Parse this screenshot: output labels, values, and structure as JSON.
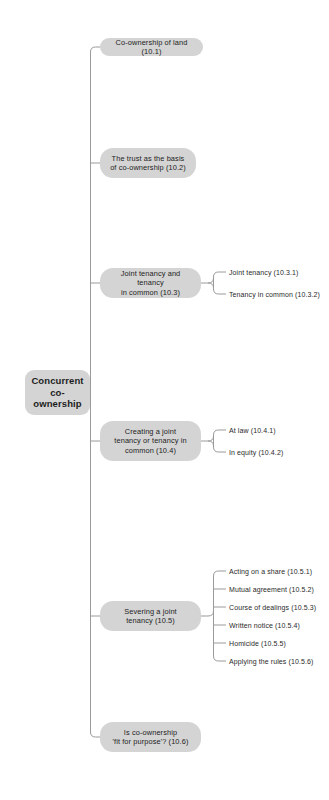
{
  "diagram": {
    "title": "Concurrent co-ownership",
    "type": "mind-map",
    "orientation": "left-to-right",
    "colors": {
      "node_fill": "#d4d4d4",
      "node_text": "#1d1d1d",
      "leaf_text": "#2a2a2a",
      "connector": "#9a9a9a",
      "background": "#ffffff"
    }
  },
  "root": {
    "label": "Concurrent\nco-ownership"
  },
  "branches": [
    {
      "id": "10.1",
      "label": "Co-ownership of land (10.1)",
      "leaves": []
    },
    {
      "id": "10.2",
      "label": "The trust as the basis\nof co-ownership (10.2)",
      "leaves": []
    },
    {
      "id": "10.3",
      "label": "Joint tenancy and tenancy\nin common (10.3)",
      "leaves": [
        {
          "id": "10.3.1",
          "label": "Joint tenancy (10.3.1)"
        },
        {
          "id": "10.3.2",
          "label": "Tenancy in common (10.3.2)"
        }
      ]
    },
    {
      "id": "10.4",
      "label": "Creating a joint\ntenancy or tenancy in\ncommon (10.4)",
      "leaves": [
        {
          "id": "10.4.1",
          "label": "At law (10.4.1)"
        },
        {
          "id": "10.4.2",
          "label": "In equity (10.4.2)"
        }
      ]
    },
    {
      "id": "10.5",
      "label": "Severing a joint\ntenancy (10.5)",
      "leaves": [
        {
          "id": "10.5.1",
          "label": "Acting on a share (10.5.1)"
        },
        {
          "id": "10.5.2",
          "label": "Mutual agreement (10.5.2)"
        },
        {
          "id": "10.5.3",
          "label": "Course of dealings (10.5.3)"
        },
        {
          "id": "10.5.4",
          "label": "Written notice (10.5.4)"
        },
        {
          "id": "10.5.5",
          "label": "Homicide (10.5.5)"
        },
        {
          "id": "10.5.6",
          "label": "Applying the rules (10.5.6)"
        }
      ]
    },
    {
      "id": "10.6",
      "label": "Is co-ownership\n'fit for purpose'? (10.6)",
      "leaves": []
    }
  ]
}
